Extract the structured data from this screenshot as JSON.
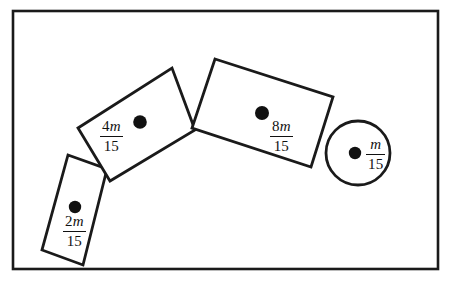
{
  "figure": {
    "background_color": "#ffffff",
    "stroke_color": "#1a1a1a",
    "border": {
      "name": "figure-frame",
      "x": 13,
      "y": 11,
      "width": 425,
      "height": 258,
      "stroke_width": 2.6
    },
    "shapes": [
      {
        "id": "small-rectangle",
        "type": "rectangle",
        "label_numerator": "2m",
        "label_denominator": "15",
        "points": "68,155 107,169 83,265 42,250",
        "stroke_width": 2.8,
        "dot": {
          "cx": 75,
          "cy": 207,
          "r": 6.2
        },
        "label_position": {
          "x": 63,
          "y": 214
        }
      },
      {
        "id": "medium-rectangle",
        "type": "rectangle",
        "label_numerator": "4m",
        "label_denominator": "15",
        "points": "78,128 172,68 195,130 110,181",
        "stroke_width": 2.8,
        "dot": {
          "cx": 140,
          "cy": 122,
          "r": 6.8
        },
        "label_position": {
          "x": 100,
          "y": 119
        }
      },
      {
        "id": "large-rectangle",
        "type": "rectangle",
        "label_numerator": "8m",
        "label_denominator": "15",
        "points": "215,59 333,97 311,167 192,128",
        "stroke_width": 2.8,
        "dot": {
          "cx": 262,
          "cy": 113,
          "r": 7.0
        },
        "label_position": {
          "x": 270,
          "y": 119
        }
      },
      {
        "id": "circle",
        "type": "circle",
        "label_numerator": "m",
        "label_denominator": "15",
        "cx": 358,
        "cy": 153,
        "r": 32,
        "stroke_width": 2.8,
        "dot": {
          "cx": 355,
          "cy": 153,
          "r": 6.2
        },
        "label_position": {
          "x": 366,
          "y": 137
        }
      }
    ]
  }
}
